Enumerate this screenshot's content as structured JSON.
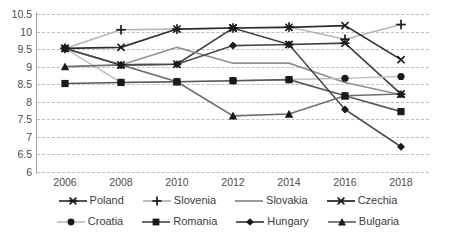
{
  "chart_data": {
    "type": "line",
    "title": "",
    "xlabel": "",
    "ylabel": "",
    "categories": [
      2006,
      2008,
      2010,
      2012,
      2014,
      2016,
      2018
    ],
    "x_tick_labels": [
      "2006",
      "2008",
      "2010",
      "2012",
      "2014",
      "2016",
      "2018"
    ],
    "y_tick_labels": [
      "10.5",
      "10",
      "9.5",
      "9",
      "8.5",
      "8",
      "7.5",
      "7",
      "6.5",
      "6"
    ],
    "y_ticks": [
      10.5,
      10,
      9.5,
      9,
      8.5,
      8,
      7.5,
      7,
      6.5,
      6
    ],
    "ylim": [
      6,
      10.5
    ],
    "grid": "horizontal-dashed",
    "legend_position": "bottom",
    "series": [
      {
        "name": "Poland",
        "marker": "x-asterisk",
        "color": "#3f3f3f",
        "values": [
          9.52,
          9.05,
          9.07,
          10.1,
          9.63,
          9.67,
          8.22
        ]
      },
      {
        "name": "Slovenia",
        "marker": "plus",
        "color": "#b5b5b5",
        "values": [
          9.52,
          10.05,
          10.07,
          10.1,
          10.13,
          9.78,
          10.2
        ]
      },
      {
        "name": "Slovakia",
        "marker": "none",
        "color": "#8f8f8f",
        "values": [
          9.52,
          9.05,
          9.55,
          9.1,
          9.1,
          8.55,
          8.2
        ]
      },
      {
        "name": "Czechia",
        "marker": "x",
        "color": "#2e2e2e",
        "values": [
          9.52,
          9.55,
          10.07,
          10.1,
          10.12,
          10.17,
          9.2
        ]
      },
      {
        "name": "Croatia",
        "marker": "circle",
        "color": "#c2c2c2",
        "values": [
          9.52,
          8.55,
          8.57,
          8.6,
          8.63,
          8.67,
          8.72
        ]
      },
      {
        "name": "Romania",
        "marker": "square",
        "color": "#5a5a5a",
        "values": [
          8.52,
          8.55,
          8.57,
          8.6,
          8.63,
          8.17,
          7.72
        ]
      },
      {
        "name": "Hungary",
        "marker": "diamond",
        "color": "#4a4a4a",
        "values": [
          9.52,
          9.05,
          9.07,
          9.6,
          9.63,
          7.78,
          6.72
        ]
      },
      {
        "name": "Bulgaria",
        "marker": "triangle",
        "color": "#6e6e6e",
        "values": [
          9.0,
          9.05,
          8.57,
          7.6,
          7.65,
          8.17,
          8.22
        ]
      }
    ]
  },
  "legend": {
    "rows": [
      [
        {
          "label": "Poland",
          "marker": "x-asterisk",
          "color": "#3f3f3f"
        },
        {
          "label": "Slovenia",
          "marker": "plus",
          "color": "#b5b5b5"
        },
        {
          "label": "Slovakia",
          "marker": "none",
          "color": "#8f8f8f"
        },
        {
          "label": "Czechia",
          "marker": "x",
          "color": "#2e2e2e"
        }
      ],
      [
        {
          "label": "Croatia",
          "marker": "circle",
          "color": "#c2c2c2"
        },
        {
          "label": "Romania",
          "marker": "square",
          "color": "#5a5a5a"
        },
        {
          "label": "Hungary",
          "marker": "diamond",
          "color": "#4a4a4a"
        },
        {
          "label": "Bulgaria",
          "marker": "triangle",
          "color": "#6e6e6e"
        }
      ]
    ]
  },
  "colors": {
    "gridline": "#bdbdbd",
    "axis": "#a6a6a6",
    "tick_text": "#4d4d4d",
    "background": "#ffffff"
  }
}
